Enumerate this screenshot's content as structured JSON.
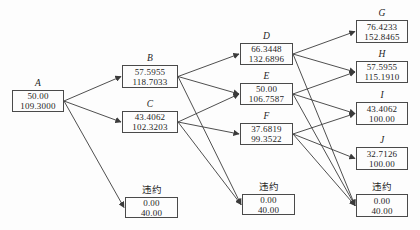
{
  "figure": {
    "type": "lattice-tree-diagram",
    "default_label": "违约"
  },
  "colors": {
    "line": "#3b3b3b",
    "border": "#4a4a4a",
    "text": "#1d1d1d",
    "background": "#fdfdfd"
  },
  "nodes": [
    {
      "id": "A",
      "label": "A",
      "line1": "50.00",
      "line2": "109.3000"
    },
    {
      "id": "B",
      "label": "B",
      "line1": "57.5955",
      "line2": "118.7033"
    },
    {
      "id": "C",
      "label": "C",
      "line1": "43.4062",
      "line2": "102.3203"
    },
    {
      "id": "D",
      "label": "D",
      "line1": "66.3448",
      "line2": "132.6896"
    },
    {
      "id": "E",
      "label": "E",
      "line1": "50.00",
      "line2": "106.7587"
    },
    {
      "id": "F",
      "label": "F",
      "line1": "37.6819",
      "line2": "99.3522"
    },
    {
      "id": "G",
      "label": "G",
      "line1": "76.4233",
      "line2": "152.8465"
    },
    {
      "id": "H",
      "label": "H",
      "line1": "57.5955",
      "line2": "115.1910"
    },
    {
      "id": "I",
      "label": "I",
      "line1": "43.4062",
      "line2": "100.00"
    },
    {
      "id": "J",
      "label": "J",
      "line1": "32.7126",
      "line2": "100.00"
    },
    {
      "id": "default-1",
      "label": "违约",
      "line1": "0.00",
      "line2": "40.00"
    },
    {
      "id": "default-2",
      "label": "违约",
      "line1": "0.00",
      "line2": "40.00"
    },
    {
      "id": "default-3",
      "label": "违约",
      "line1": "0.00",
      "line2": "40.00"
    }
  ],
  "edges": [
    {
      "from": "A",
      "to": "B"
    },
    {
      "from": "A",
      "to": "C"
    },
    {
      "from": "A",
      "to": "default-1"
    },
    {
      "from": "B",
      "to": "D"
    },
    {
      "from": "B",
      "to": "E"
    },
    {
      "from": "B",
      "to": "default-2"
    },
    {
      "from": "C",
      "to": "E"
    },
    {
      "from": "C",
      "to": "F"
    },
    {
      "from": "C",
      "to": "default-2"
    },
    {
      "from": "D",
      "to": "G"
    },
    {
      "from": "D",
      "to": "H"
    },
    {
      "from": "D",
      "to": "default-3"
    },
    {
      "from": "E",
      "to": "H"
    },
    {
      "from": "E",
      "to": "I"
    },
    {
      "from": "E",
      "to": "default-3"
    },
    {
      "from": "F",
      "to": "I"
    },
    {
      "from": "F",
      "to": "J"
    },
    {
      "from": "F",
      "to": "default-3"
    }
  ]
}
